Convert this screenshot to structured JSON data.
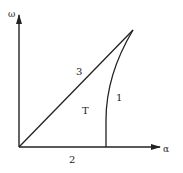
{
  "diagram": {
    "axes": {
      "y_label": "ω",
      "x_label": "α"
    },
    "curves": [
      {
        "id": "1",
        "label": "1",
        "description": "curved boundary from x-axis to apex"
      },
      {
        "id": "2",
        "label": "2",
        "description": "segment along x-axis"
      },
      {
        "id": "3",
        "label": "3",
        "description": "straight diagonal from origin to apex"
      }
    ],
    "region_label": "T",
    "colors": {
      "line": "#222222",
      "background": "#ffffff"
    }
  }
}
